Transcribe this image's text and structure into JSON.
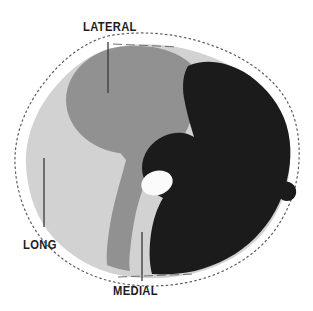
{
  "figure": {
    "kind": "anatomical-cross-section",
    "background_color": "#ffffff"
  },
  "labels": {
    "lateral": "LATERAL",
    "long": "LONG",
    "medial": "MEDIAL"
  },
  "regions": [
    {
      "key": "long",
      "label": "LONG",
      "fill": "#d2d2d2",
      "tone": "light-gray"
    },
    {
      "key": "lateral",
      "label": "LATERAL",
      "fill": "#919191",
      "tone": "medium-gray"
    },
    {
      "key": "medial",
      "label": "MEDIAL",
      "fill": "#919191",
      "tone": "medium-gray"
    },
    {
      "key": "dark",
      "label": "",
      "fill": "#1b1b1b",
      "tone": "near-black"
    },
    {
      "key": "lumen",
      "label": "",
      "fill": "#fbfbfb",
      "tone": "white-oval"
    }
  ],
  "colors": {
    "light_gray": "#d2d2d2",
    "medium_gray": "#919191",
    "dark": "#1b1b1b",
    "white_oval": "#fbfbfb",
    "outline": "#5c5c5c",
    "leader_line": "#3a3a3a",
    "text": "#1d1d1d"
  },
  "leaders": [
    {
      "key": "lateral",
      "x1": 108,
      "y1": 42,
      "x2": 108,
      "y2": 93
    },
    {
      "key": "long",
      "x1": 44,
      "y1": 158,
      "x2": 44,
      "y2": 227
    },
    {
      "key": "medial",
      "x1": 142,
      "y1": 232,
      "x2": 142,
      "y2": 281
    }
  ],
  "scale_marks": {
    "top": {
      "y": 44,
      "x_start": 113,
      "x_end": 178
    },
    "bottom": {
      "y": 276,
      "x_start": 118,
      "x_end": 195
    }
  }
}
